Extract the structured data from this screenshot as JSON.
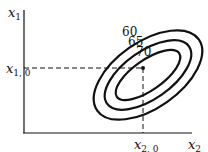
{
  "axes": {
    "y_label": "x",
    "y_label_sub": "1",
    "x_label": "x",
    "x_label_sub": "2",
    "y0_label": "x",
    "y0_label_sub": "1, 0",
    "x0_label": "x",
    "x0_label_sub": "2, 0"
  },
  "contours": [
    {
      "level": "60"
    },
    {
      "level": "65"
    },
    {
      "level": "70"
    }
  ],
  "colors": {
    "line": "#111111",
    "background": "#ffffff"
  }
}
